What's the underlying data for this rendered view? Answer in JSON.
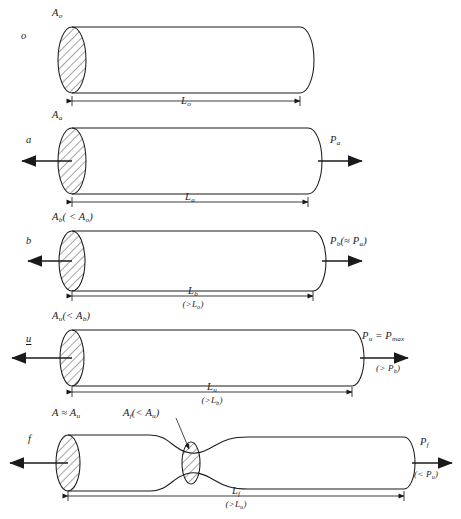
{
  "figure": {
    "type": "engineering-diagram",
    "stroke_color": "#1a1a1a",
    "background_color": "#ffffff",
    "stages": [
      {
        "id": "stage-o",
        "state_label": "o",
        "area_label": "A",
        "area_sub": "o",
        "area_note": "",
        "length_label": "L",
        "length_sub": "o",
        "length_note": "",
        "load_label": "",
        "load_note": "",
        "has_force_arrows": false,
        "has_neck": false
      },
      {
        "id": "stage-a",
        "state_label": "a",
        "area_label": "A",
        "area_sub": "a",
        "area_note": "",
        "length_label": "L",
        "length_sub": "a",
        "length_note": "",
        "load_label": "P",
        "load_sub": "a",
        "load_note": "",
        "has_force_arrows": true,
        "has_neck": false
      },
      {
        "id": "stage-b",
        "state_label": "b",
        "area_label": "A",
        "area_sub": "b",
        "area_note": "( < Aₐ)",
        "length_label": "L",
        "length_sub": "b",
        "length_note": "(>Lₐ)",
        "load_label": "P",
        "load_sub": "b",
        "load_note": "(≈ Pₐ)",
        "has_force_arrows": true,
        "has_neck": false
      },
      {
        "id": "stage-u",
        "state_label": "u",
        "area_label": "A",
        "area_sub": "u",
        "area_note": "(< A_b)",
        "length_label": "L",
        "length_sub": "u",
        "length_note": "(>L_b)",
        "load_label": "P",
        "load_sub": "u",
        "load_note": "(> P_b)",
        "load_equals": "= P_max",
        "has_force_arrows": true,
        "has_neck": false
      },
      {
        "id": "stage-f",
        "state_label": "f",
        "area_label": "A",
        "area_sub": "",
        "area_note": "≈ A_u",
        "neck_area_label": "A_f",
        "neck_area_note": "(< A_u)",
        "length_label": "L",
        "length_sub": "f",
        "length_note": "(>L_u)",
        "load_label": "P",
        "load_sub": "f",
        "load_note": "(< P_u)",
        "has_force_arrows": true,
        "has_neck": true
      }
    ],
    "text": {
      "row1_area": "A",
      "row1_area_sub": "o",
      "row1_state": "o",
      "row1_length": "L",
      "row1_length_sub": "o",
      "row2_area": "A",
      "row2_area_sub": "a",
      "row2_state": "a",
      "row2_length": "L",
      "row2_length_sub": "a",
      "row2_load": "P",
      "row2_load_sub": "a",
      "row3_area": "A",
      "row3_area_sub": "b",
      "row3_area_cmp": "( < A",
      "row3_area_cmp_sub": "o",
      "row3_area_cmp_end": ")",
      "row3_state": "b",
      "row3_length": "L",
      "row3_length_sub": "b",
      "row3_length_cmp": "(>L",
      "row3_length_cmp_sub": "o",
      "row3_length_cmp_end": ")",
      "row3_load": "P",
      "row3_load_sub": "b",
      "row3_load_cmp": "(≈ P",
      "row3_load_cmp_sub": "a",
      "row3_load_cmp_end": ")",
      "row4_area": "A",
      "row4_area_sub": "u",
      "row4_area_cmp": "(< A",
      "row4_area_cmp_sub": "b",
      "row4_area_cmp_end": ")",
      "row4_state": "u",
      "row4_length": "L",
      "row4_length_sub": "u",
      "row4_length_cmp": "(>L",
      "row4_length_cmp_sub": "b",
      "row4_length_cmp_end": ")",
      "row4_load": "P",
      "row4_load_sub": "u",
      "row4_load_eq": " = P",
      "row4_load_eq_sub": "max",
      "row4_load_cmp": "(> P",
      "row4_load_cmp_sub": "b",
      "row4_load_cmp_end": ")",
      "row5_area": "A ≈ A",
      "row5_area_sub": "u",
      "row5_neck_area": "A",
      "row5_neck_area_sub": "f",
      "row5_neck_cmp": "(< A",
      "row5_neck_cmp_sub": "u",
      "row5_neck_cmp_end": ")",
      "row5_state": "f",
      "row5_length": "L",
      "row5_length_sub": "f",
      "row5_length_cmp": "(>L",
      "row5_length_cmp_sub": "u",
      "row5_length_cmp_end": ")",
      "row5_load": "P",
      "row5_load_sub": "f",
      "row5_load_cmp": "(< P",
      "row5_load_cmp_sub": "u",
      "row5_load_cmp_end": ")"
    }
  }
}
